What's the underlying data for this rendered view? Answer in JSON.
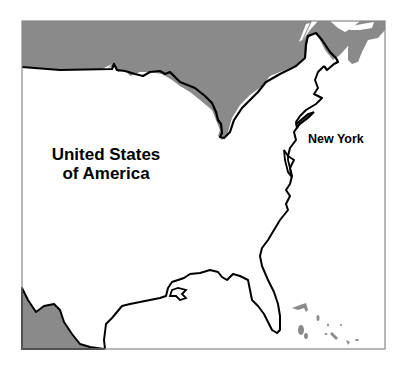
{
  "map": {
    "labels": {
      "country": "United States of America",
      "country_line1": "United States",
      "country_line2": "of America",
      "state": "New York"
    },
    "colors": {
      "land_foreign": "#8a8a8a",
      "land_usa": "#ffffff",
      "water": "#ffffff",
      "coastline": "#000000",
      "frame": "#888888",
      "islands": "#8a8a8a"
    },
    "regions": [
      "Canada",
      "Mexico",
      "Bahamas",
      "United States of America"
    ],
    "highlighted_region": "New York"
  }
}
